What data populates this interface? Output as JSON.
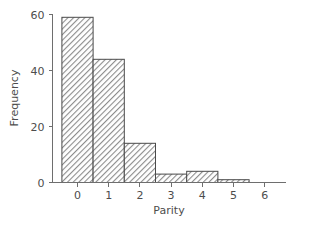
{
  "chart_data": {
    "type": "bar",
    "title": "",
    "subtitle": "",
    "xlabel": "Parity",
    "ylabel": "Frequency",
    "categories": [
      "0",
      "1",
      "2",
      "3",
      "4",
      "5",
      "6"
    ],
    "values": [
      59,
      44,
      14,
      3,
      4,
      1,
      0
    ],
    "x": [
      0,
      1,
      2,
      3,
      4,
      5,
      6
    ],
    "xlim": [
      -0.5,
      6.5
    ],
    "ylim": [
      0,
      62
    ],
    "xticks": [
      0,
      1,
      2,
      3,
      4,
      5,
      6
    ],
    "yticks": [
      0,
      20,
      40,
      60
    ],
    "xtick_labels": [
      "0",
      "1",
      "2",
      "3",
      "4",
      "5",
      "6"
    ],
    "ytick_labels": [
      "0",
      "20",
      "40",
      "60"
    ],
    "grid": false,
    "legend": null,
    "legend_position": "none",
    "bar_width": 1.0,
    "annotations": [],
    "style": {
      "bar_fill": "#9a9a9a",
      "bar_edge": "#4a4a4a",
      "hatch": "diagonal",
      "axis_color": "#6e6e6e",
      "text_color": "#4d4d4d",
      "background": "#ffffff"
    }
  },
  "axes": {
    "x_title": "Parity",
    "y_title": "Frequency"
  }
}
